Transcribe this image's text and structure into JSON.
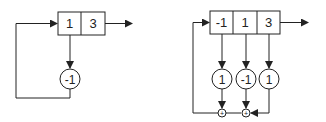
{
  "diagram": {
    "left": {
      "register_cells": [
        "1",
        "3"
      ],
      "multipliers": [
        "-1"
      ]
    },
    "right": {
      "register_cells": [
        "-1",
        "1",
        "3"
      ],
      "multipliers": [
        "1",
        "-1",
        "1"
      ],
      "adders": [
        "+",
        "+"
      ]
    },
    "colors": {
      "stroke": "#222222",
      "background": "#ffffff"
    }
  }
}
